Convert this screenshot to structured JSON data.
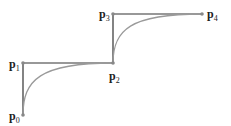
{
  "diagram": {
    "title": "",
    "points": [
      {
        "id": "p0",
        "label": "p",
        "sub": "0",
        "x": 23,
        "y": 115
      },
      {
        "id": "p1",
        "label": "p",
        "sub": "1",
        "x": 23,
        "y": 63
      },
      {
        "id": "p2",
        "label": "p",
        "sub": "2",
        "x": 113,
        "y": 63
      },
      {
        "id": "p3",
        "label": "p",
        "sub": "3",
        "x": 113,
        "y": 14
      },
      {
        "id": "p4",
        "label": "p",
        "sub": "4",
        "x": 202,
        "y": 14
      }
    ],
    "colors": {
      "polygon": "#333333",
      "curve": "#999999",
      "point": "#888888"
    }
  }
}
